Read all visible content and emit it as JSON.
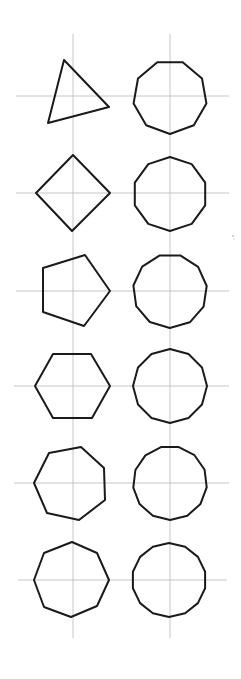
{
  "diagram": {
    "title": "",
    "colors": {
      "background": "#ffffff",
      "stroke": "#1a1a1a",
      "grid": "#b8b8b8"
    },
    "grid": {
      "vertical_lines": [
        {
          "x": 73,
          "y1": 34,
          "y2": 638
        },
        {
          "x": 170,
          "y1": 34,
          "y2": 638
        }
      ],
      "horizontal_lines": [
        {
          "y": 96,
          "x1": 16,
          "x2": 229
        },
        {
          "y": 193,
          "x1": 16,
          "x2": 229
        },
        {
          "y": 291,
          "x1": 16,
          "x2": 229
        },
        {
          "y": 386,
          "x1": 14,
          "x2": 229
        },
        {
          "y": 483,
          "x1": 14,
          "x2": 229
        },
        {
          "y": 580,
          "x1": 18,
          "x2": 227
        }
      ]
    },
    "shapes": [
      {
        "name": "triangle",
        "sides": 3,
        "column": "left",
        "row": 1,
        "points": [
          [
            64,
            60
          ],
          [
            109,
            107
          ],
          [
            48,
            123
          ]
        ]
      },
      {
        "name": "square",
        "sides": 4,
        "column": "left",
        "row": 2,
        "points": [
          [
            73,
            155
          ],
          [
            110,
            193
          ],
          [
            72,
            231
          ],
          [
            36,
            193
          ]
        ]
      },
      {
        "name": "pentagon",
        "sides": 5,
        "column": "left",
        "row": 3,
        "points": [
          [
            110,
            291
          ],
          [
            85,
            255
          ],
          [
            43,
            268
          ],
          [
            43,
            312
          ],
          [
            84,
            326
          ]
        ]
      },
      {
        "name": "hexagon",
        "sides": 6,
        "column": "left",
        "row": 4,
        "points": [
          [
            35,
            386
          ],
          [
            53,
            354
          ],
          [
            91,
            354
          ],
          [
            110,
            386
          ],
          [
            92,
            418
          ],
          [
            53,
            418
          ]
        ]
      },
      {
        "name": "heptagon",
        "sides": 7,
        "column": "left",
        "row": 5,
        "points": [
          [
            34,
            483
          ],
          [
            49,
            453
          ],
          [
            81,
            447
          ],
          [
            104,
            468
          ],
          [
            105,
            500
          ],
          [
            79,
            520
          ],
          [
            47,
            513
          ]
        ]
      },
      {
        "name": "octagon",
        "sides": 8,
        "column": "left",
        "row": 6,
        "points": [
          [
            72,
            542
          ],
          [
            97,
            553
          ],
          [
            109,
            580
          ],
          [
            97,
            606
          ],
          [
            71,
            617
          ],
          [
            44,
            607
          ],
          [
            34,
            580
          ],
          [
            44,
            553
          ]
        ]
      },
      {
        "name": "nonagon",
        "sides": 9,
        "column": "right",
        "row": 1,
        "center": [
          170,
          97
        ],
        "radius": 37,
        "rotation_deg": -110
      },
      {
        "name": "decagon",
        "sides": 10,
        "column": "right",
        "row": 2,
        "center": [
          170,
          194
        ],
        "radius": 37,
        "rotation_deg": -90
      },
      {
        "name": "hendecagon",
        "sides": 11,
        "column": "right",
        "row": 3,
        "center": [
          170,
          291
        ],
        "radius": 37,
        "rotation_deg": -106
      },
      {
        "name": "dodecagon",
        "sides": 12,
        "column": "right",
        "row": 4,
        "center": [
          170,
          386
        ],
        "radius": 37,
        "rotation_deg": -90
      },
      {
        "name": "tridecagon",
        "sides": 13,
        "column": "right",
        "row": 5,
        "center": [
          170,
          483
        ],
        "radius": 37,
        "rotation_deg": -104
      },
      {
        "name": "tetradecagon",
        "sides": 14,
        "column": "right",
        "row": 6,
        "center": [
          169,
          580
        ],
        "radius": 37,
        "rotation_deg": -90
      }
    ],
    "specks": [
      {
        "x": 233,
        "y": 236,
        "r": 0.8
      },
      {
        "x": 234,
        "y": 239,
        "r": 0.6
      }
    ]
  }
}
